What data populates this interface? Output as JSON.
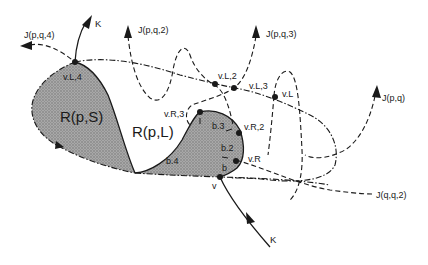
{
  "figure": {
    "regions": [
      {
        "id": "R_pS",
        "label": "R(p,S)"
      },
      {
        "id": "R_pL",
        "label": "R(p,L)"
      }
    ],
    "curves": [
      {
        "id": "K_top",
        "label": "K"
      },
      {
        "id": "K_bottom",
        "label": "K"
      },
      {
        "id": "J_pq4",
        "label": "J(p,q,4)"
      },
      {
        "id": "J_pq2",
        "label": "J(p,q,2)"
      },
      {
        "id": "J_pq3",
        "label": "J(p,q,3)"
      },
      {
        "id": "J_pq",
        "label": "J(p,q)"
      },
      {
        "id": "J_qq2",
        "label": "J(q,q,2)"
      }
    ],
    "vertices": [
      {
        "id": "vL4",
        "label": "v.L,4"
      },
      {
        "id": "vL2",
        "label": "v.L,2"
      },
      {
        "id": "vL3",
        "label": "v.L,3"
      },
      {
        "id": "vL",
        "label": "v.L"
      },
      {
        "id": "vR3",
        "label": "v.R,3"
      },
      {
        "id": "vR2",
        "label": "v.R,2"
      },
      {
        "id": "vR",
        "label": "v.R"
      },
      {
        "id": "v",
        "label": "v"
      }
    ],
    "boundary_segments": [
      {
        "id": "b4",
        "label": "b.4"
      },
      {
        "id": "b3",
        "label": "b.3"
      },
      {
        "id": "b2",
        "label": "b.2"
      },
      {
        "id": "b",
        "label": "b"
      }
    ],
    "colors": {
      "ink": "#1a1a1a",
      "region_fill": "#9a9a9a",
      "background": "#ffffff"
    }
  }
}
